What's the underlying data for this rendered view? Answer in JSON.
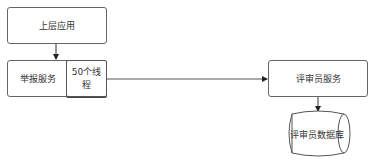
{
  "diagram": {
    "nodes": {
      "upper_app": {
        "label": "上层应用"
      },
      "report_service": {
        "label": "举报服务"
      },
      "thread_pool": {
        "label": "50个线程"
      },
      "reviewer_service": {
        "label": "评审员服务"
      },
      "reviewer_db": {
        "label": "评审员数据库"
      }
    },
    "edges": [
      {
        "from": "上层应用",
        "to": "举报服务"
      },
      {
        "from": "50个线程",
        "to": "评审员服务"
      },
      {
        "from": "评审员服务",
        "to": "评审员数据库"
      }
    ]
  }
}
